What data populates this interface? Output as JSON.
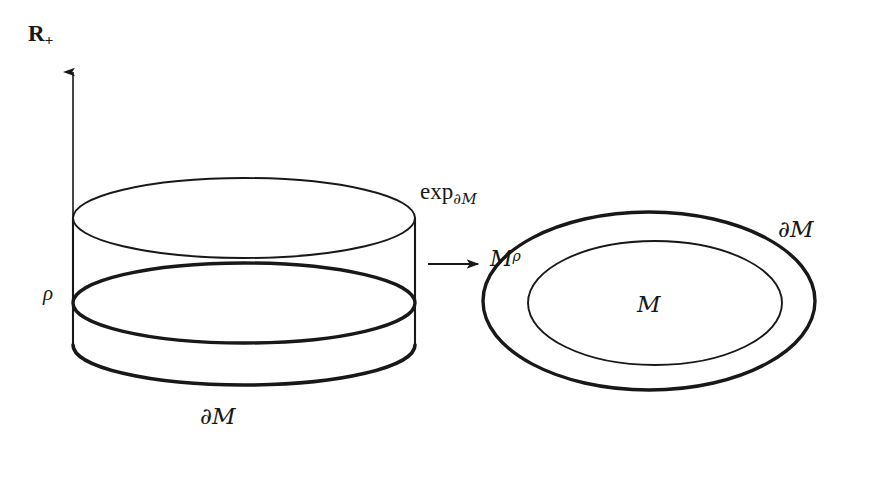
{
  "figure": {
    "kind": "mathematical-diagram",
    "background_color": "#ffffff",
    "ink_color": "#181818"
  },
  "axis": {
    "name": "positive-real-axis",
    "label": "R",
    "label_subscript": "+",
    "arrow_direction": "up",
    "x": 73,
    "y_top": 70,
    "y_bottom": 342
  },
  "marks": {
    "rho": "ρ"
  },
  "left_figure": {
    "name": "collar-cylinder",
    "center_x": 228,
    "left_x": 73,
    "right_x": 415,
    "top_ellipse": {
      "cy": 218,
      "rx": 171,
      "ry": 40,
      "weight": "thin"
    },
    "mid_ellipse": {
      "cy": 303,
      "rx": 171,
      "ry": 40,
      "weight": "bold"
    },
    "bottom_arc": {
      "cy": 345,
      "rx": 171,
      "ry": 40,
      "weight": "bold"
    },
    "bottom_label": "∂M"
  },
  "map_arrow": {
    "name": "exponential-map-arrow",
    "label_main": "exp",
    "label_subscript": "∂M",
    "x_start": 428,
    "x_end": 484,
    "y": 264
  },
  "right_figure": {
    "name": "manifold-with-collar",
    "outer": {
      "label": "∂M",
      "weight": "bold",
      "cx": 649,
      "cy": 301,
      "rx": 166,
      "ry": 89
    },
    "inner": {
      "label": "M",
      "weight": "thin",
      "cx": 655,
      "cy": 303,
      "rx": 127,
      "ry": 62
    },
    "annulus_label": "M",
    "annulus_label_superscript": "ρ"
  },
  "colors": {
    "ink": "#181818",
    "paper": "#ffffff"
  }
}
